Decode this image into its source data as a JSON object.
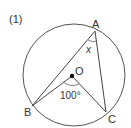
{
  "problem_number": "(1)",
  "points": {
    "A": "A",
    "B": "B",
    "C": "C",
    "O": "O"
  },
  "angle_x": "x",
  "angle_center": "100°",
  "colors": {
    "stroke": "#444444",
    "text": "#333333"
  }
}
